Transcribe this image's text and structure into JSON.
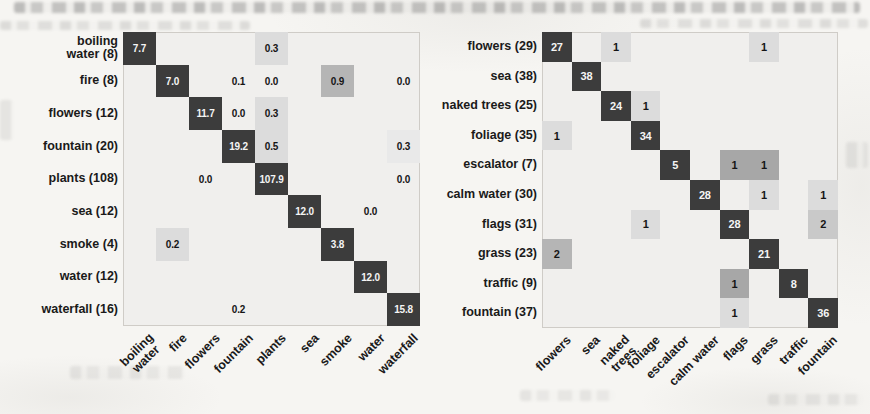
{
  "palette": {
    "dark": "#3c3c3c",
    "medium": "#a7a7a7",
    "med": "#b5b5b5",
    "lightmed": "#c9c9c9",
    "light": "#dcdcdc",
    "faint": "#e9e9e9",
    "plot_bg": "#f0efed",
    "text_on_dark": "#f4f4f4",
    "text_on_light": "#151515"
  },
  "chart_data": [
    {
      "type": "heatmap",
      "title": "",
      "legend": "none",
      "grid": "off",
      "row_labels": [
        "boiling\nwater (8)",
        "fire (8)",
        "flowers (12)",
        "fountain (20)",
        "plants (108)",
        "sea (12)",
        "smoke (4)",
        "water (12)",
        "waterfall (16)"
      ],
      "col_labels": [
        "boiling\nwater",
        "fire",
        "flowers",
        "fountain",
        "plants",
        "sea",
        "smoke",
        "water",
        "waterfall"
      ],
      "cells": [
        {
          "r": 0,
          "c": 0,
          "v": "7.7",
          "shade": "dark"
        },
        {
          "r": 0,
          "c": 4,
          "v": "0.3",
          "shade": "light"
        },
        {
          "r": 1,
          "c": 1,
          "v": "7.0",
          "shade": "dark"
        },
        {
          "r": 1,
          "c": 3,
          "v": "0.1",
          "shade": "none"
        },
        {
          "r": 1,
          "c": 4,
          "v": "0.0",
          "shade": "none"
        },
        {
          "r": 1,
          "c": 6,
          "v": "0.9",
          "shade": "med"
        },
        {
          "r": 1,
          "c": 8,
          "v": "0.0",
          "shade": "none"
        },
        {
          "r": 2,
          "c": 2,
          "v": "11.7",
          "shade": "dark"
        },
        {
          "r": 2,
          "c": 3,
          "v": "0.0",
          "shade": "none"
        },
        {
          "r": 2,
          "c": 4,
          "v": "0.3",
          "shade": "light"
        },
        {
          "r": 3,
          "c": 3,
          "v": "19.2",
          "shade": "dark"
        },
        {
          "r": 3,
          "c": 4,
          "v": "0.5",
          "shade": "light"
        },
        {
          "r": 3,
          "c": 8,
          "v": "0.3",
          "shade": "faint"
        },
        {
          "r": 4,
          "c": 2,
          "v": "0.0",
          "shade": "none"
        },
        {
          "r": 4,
          "c": 4,
          "v": "107.9",
          "shade": "dark"
        },
        {
          "r": 4,
          "c": 8,
          "v": "0.0",
          "shade": "none"
        },
        {
          "r": 5,
          "c": 5,
          "v": "12.0",
          "shade": "dark"
        },
        {
          "r": 5,
          "c": 7,
          "v": "0.0",
          "shade": "none"
        },
        {
          "r": 6,
          "c": 1,
          "v": "0.2",
          "shade": "light"
        },
        {
          "r": 6,
          "c": 6,
          "v": "3.8",
          "shade": "dark"
        },
        {
          "r": 7,
          "c": 7,
          "v": "12.0",
          "shade": "dark"
        },
        {
          "r": 8,
          "c": 3,
          "v": "0.2",
          "shade": "none"
        },
        {
          "r": 8,
          "c": 8,
          "v": "15.8",
          "shade": "dark"
        }
      ]
    },
    {
      "type": "heatmap",
      "title": "",
      "legend": "none",
      "grid": "off",
      "row_labels": [
        "flowers (29)",
        "sea (38)",
        "naked trees (25)",
        "foliage (35)",
        "escalator (7)",
        "calm water (30)",
        "flags (31)",
        "grass (23)",
        "traffic (9)",
        "fountain (37)"
      ],
      "col_labels": [
        "flowers",
        "sea",
        "naked\ntrees",
        "foliage",
        "escalator",
        "calm water",
        "flags",
        "grass",
        "traffic",
        "fountain"
      ],
      "cells": [
        {
          "r": 0,
          "c": 0,
          "v": "27",
          "shade": "dark"
        },
        {
          "r": 0,
          "c": 2,
          "v": "1",
          "shade": "light"
        },
        {
          "r": 0,
          "c": 7,
          "v": "1",
          "shade": "light"
        },
        {
          "r": 1,
          "c": 1,
          "v": "38",
          "shade": "dark"
        },
        {
          "r": 2,
          "c": 2,
          "v": "24",
          "shade": "dark"
        },
        {
          "r": 2,
          "c": 3,
          "v": "1",
          "shade": "light"
        },
        {
          "r": 3,
          "c": 0,
          "v": "1",
          "shade": "light"
        },
        {
          "r": 3,
          "c": 3,
          "v": "34",
          "shade": "dark"
        },
        {
          "r": 4,
          "c": 4,
          "v": "5",
          "shade": "dark"
        },
        {
          "r": 4,
          "c": 6,
          "v": "1",
          "shade": "medium"
        },
        {
          "r": 4,
          "c": 7,
          "v": "1",
          "shade": "medium"
        },
        {
          "r": 5,
          "c": 5,
          "v": "28",
          "shade": "dark"
        },
        {
          "r": 5,
          "c": 7,
          "v": "1",
          "shade": "light"
        },
        {
          "r": 5,
          "c": 9,
          "v": "1",
          "shade": "light"
        },
        {
          "r": 6,
          "c": 3,
          "v": "1",
          "shade": "light"
        },
        {
          "r": 6,
          "c": 6,
          "v": "28",
          "shade": "dark"
        },
        {
          "r": 6,
          "c": 9,
          "v": "2",
          "shade": "lightmed"
        },
        {
          "r": 7,
          "c": 0,
          "v": "2",
          "shade": "med"
        },
        {
          "r": 7,
          "c": 7,
          "v": "21",
          "shade": "dark"
        },
        {
          "r": 8,
          "c": 6,
          "v": "1",
          "shade": "medium"
        },
        {
          "r": 8,
          "c": 8,
          "v": "8",
          "shade": "dark"
        },
        {
          "r": 9,
          "c": 6,
          "v": "1",
          "shade": "light"
        },
        {
          "r": 9,
          "c": 9,
          "v": "36",
          "shade": "dark"
        }
      ]
    }
  ]
}
